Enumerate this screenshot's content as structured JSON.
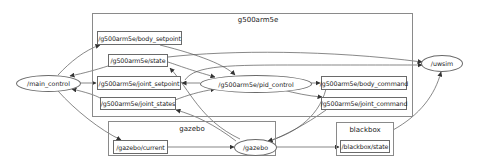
{
  "clusters": {
    "g500arm5e": {
      "title": "g500arm5e"
    },
    "gazebo": {
      "title": "gazebo"
    },
    "blackbox": {
      "title": "blackbox"
    }
  },
  "nodes": {
    "main_control": "/main_control",
    "pid_control": "/g500arm5e/pid_control",
    "uwsim": "/uwsim",
    "gazebo": "/gazebo"
  },
  "topics": {
    "body_setpoint": "/g500arm5e/body_setpoint",
    "state": "/g500arm5e/state",
    "joint_setpoint": "/g500arm5e/joint_setpoint",
    "joint_states": "/g500arm5e/joint_states",
    "body_command": "/g500arm5e/body_command",
    "joint_command": "/g500arm5e/joint_command",
    "gazebo_current": "/gazebo/current",
    "blackbox_state": "/blackbox/state"
  },
  "edges": [
    {
      "from": "/main_control",
      "to": "/g500arm5e/body_setpoint"
    },
    {
      "from": "/main_control",
      "to": "/g500arm5e/joint_setpoint"
    },
    {
      "from": "/main_control",
      "to": "/gazebo/current"
    },
    {
      "from": "/g500arm5e/state",
      "to": "/main_control"
    },
    {
      "from": "/g500arm5e/joint_states",
      "to": "/main_control"
    },
    {
      "from": "/g500arm5e/body_setpoint",
      "to": "/g500arm5e/pid_control"
    },
    {
      "from": "/g500arm5e/joint_setpoint",
      "to": "/g500arm5e/pid_control"
    },
    {
      "from": "/g500arm5e/state",
      "to": "/g500arm5e/pid_control"
    },
    {
      "from": "/g500arm5e/joint_states",
      "to": "/g500arm5e/pid_control"
    },
    {
      "from": "/g500arm5e/pid_control",
      "to": "/g500arm5e/body_command"
    },
    {
      "from": "/g500arm5e/pid_control",
      "to": "/g500arm5e/joint_command"
    },
    {
      "from": "/g500arm5e/state",
      "to": "/uwsim"
    },
    {
      "from": "/g500arm5e/joint_setpoint",
      "to": "/uwsim"
    },
    {
      "from": "/g500arm5e/body_command",
      "to": "/gazebo"
    },
    {
      "from": "/g500arm5e/joint_command",
      "to": "/gazebo"
    },
    {
      "from": "/gazebo/current",
      "to": "/gazebo"
    },
    {
      "from": "/gazebo",
      "to": "/g500arm5e/state"
    },
    {
      "from": "/gazebo",
      "to": "/g500arm5e/joint_states"
    },
    {
      "from": "/gazebo",
      "to": "/blackbox/state"
    },
    {
      "from": "/blackbox/state",
      "to": "/uwsim"
    }
  ]
}
